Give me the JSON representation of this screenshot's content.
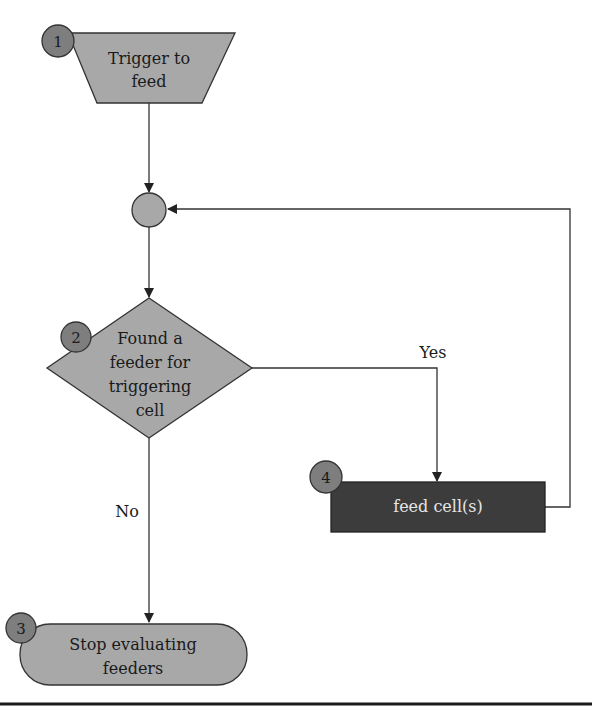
{
  "diagram": {
    "type": "flowchart",
    "colors": {
      "shape_fill": "#a8a8a8",
      "badge_fill": "#7e7e7e",
      "dark_box_fill": "#3c3c3c",
      "stroke": "#333333",
      "dark_text": "#e6e6e6",
      "border": "#1a1a1a"
    },
    "nodes": [
      {
        "id": "1",
        "shape": "trapezoid",
        "badge": "1",
        "lines": [
          "Trigger to",
          "feed"
        ]
      },
      {
        "id": "connector",
        "shape": "circle"
      },
      {
        "id": "2",
        "shape": "diamond",
        "badge": "2",
        "lines": [
          "Found a",
          "feeder for",
          "triggering",
          "cell"
        ]
      },
      {
        "id": "3",
        "shape": "terminator",
        "badge": "3",
        "lines": [
          "Stop evaluating",
          "feeders"
        ]
      },
      {
        "id": "4",
        "shape": "process",
        "badge": "4",
        "lines": [
          "feed cell(s)"
        ]
      }
    ],
    "edges": [
      {
        "from": "1",
        "to": "connector",
        "label": ""
      },
      {
        "from": "connector",
        "to": "2",
        "label": ""
      },
      {
        "from": "2",
        "to": "4",
        "label": "Yes"
      },
      {
        "from": "2",
        "to": "3",
        "label": "No"
      },
      {
        "from": "4",
        "to": "connector",
        "label": ""
      }
    ]
  }
}
